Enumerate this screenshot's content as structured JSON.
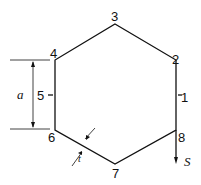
{
  "diagram": {
    "title": "",
    "vertices": [
      {
        "label": "1",
        "x": 180,
        "y": 98
      },
      {
        "label": "2",
        "x": 177,
        "y": 63
      },
      {
        "label": "3",
        "x": 116,
        "y": 22
      },
      {
        "label": "4",
        "x": 51,
        "y": 57
      },
      {
        "label": "5",
        "x": 37,
        "y": 98
      },
      {
        "label": "6",
        "x": 51,
        "y": 141
      },
      {
        "label": "7",
        "x": 116,
        "y": 178
      },
      {
        "label": "8",
        "x": 180,
        "y": 141
      }
    ],
    "dimension_a": "a",
    "thickness_t": "t",
    "force_S": "S"
  }
}
